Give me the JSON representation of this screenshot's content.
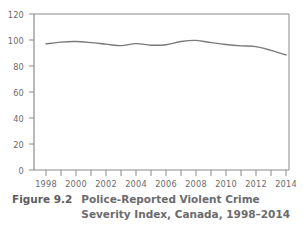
{
  "figure": {
    "label": "Figure 9.2",
    "caption_line_1": "Police-Reported Violent Crime",
    "caption_line_2": "Severity Index, Canada, 1998–2014"
  },
  "colors": {
    "line": "#7a7a7c",
    "axis": "#8a8a8c",
    "text": "#6a6a6c",
    "background": "#ffffff"
  },
  "chart_data": {
    "type": "line",
    "title": "Police-Reported Violent Crime Severity Index, Canada, 1998–2014",
    "xlabel": "",
    "ylabel": "",
    "xlim": [
      1997.4,
      2014.4
    ],
    "ylim": [
      0,
      120
    ],
    "grid": false,
    "legend": "none",
    "y_ticks": [
      0,
      20,
      40,
      60,
      80,
      100,
      120
    ],
    "y_tick_labels": [
      "0",
      "20",
      "40",
      "60",
      "80",
      "100",
      "120"
    ],
    "x_ticks": [
      1998,
      2000,
      2002,
      2004,
      2006,
      2008,
      2010,
      2012,
      2014
    ],
    "x_tick_labels": [
      "1998",
      "2000",
      "2002",
      "2004",
      "2006",
      "2008",
      "2010",
      "2012",
      "2014"
    ],
    "x_minor_ticks": [
      1999,
      2001,
      2003,
      2005,
      2007,
      2009,
      2011,
      2013
    ],
    "series": [
      {
        "name": "Violent Crime Severity Index",
        "x": [
          1998,
          1999,
          2000,
          2001,
          2002,
          2003,
          2004,
          2005,
          2006,
          2007,
          2008,
          2009,
          2010,
          2011,
          2012,
          2013,
          2014
        ],
        "values": [
          97.0,
          98.4,
          98.8,
          98.0,
          96.8,
          95.7,
          97.2,
          96.0,
          96.3,
          98.8,
          99.7,
          98.0,
          96.5,
          95.5,
          94.9,
          92.0,
          88.5
        ]
      }
    ]
  }
}
